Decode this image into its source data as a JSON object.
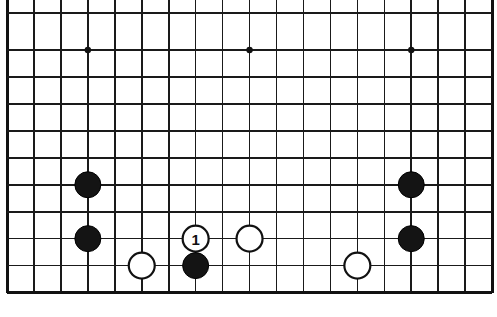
{
  "figure": {
    "kind": "go-board-diagram",
    "title": "",
    "caption": "",
    "board_size": 19,
    "colors": {
      "background": "#ffffff",
      "line": "#1a1a1a",
      "edge_line": "#111111",
      "black_stone": "#141414",
      "white_stone": "#ffffff"
    }
  },
  "board": {
    "geometry": {
      "origin_x": 7,
      "origin_y": 13,
      "spacing_x": 26.95,
      "spacing_y": 26.95,
      "cols": 19,
      "rows": 11,
      "first_row_gap": 37,
      "stone_radius": 13.0
    },
    "edges": {
      "left": true,
      "right": true,
      "top": false,
      "bottom": true
    },
    "hoshi": [
      {
        "col": 3,
        "row": 1
      },
      {
        "col": 9,
        "row": 1
      },
      {
        "col": 15,
        "row": 1
      }
    ]
  },
  "stones": [
    {
      "id": "b1",
      "color": "black",
      "col": 3,
      "row": 6,
      "label": "",
      "name": "black-stone-upper-left"
    },
    {
      "id": "b2",
      "color": "black",
      "col": 3,
      "row": 8,
      "label": "",
      "name": "black-stone-lower-left"
    },
    {
      "id": "w1",
      "color": "white",
      "col": 5,
      "row": 9,
      "label": "",
      "name": "white-stone-left"
    },
    {
      "id": "m1",
      "color": "white",
      "col": 7,
      "row": 8,
      "label": "1",
      "name": "white-stone-move-1"
    },
    {
      "id": "b3",
      "color": "black",
      "col": 7,
      "row": 9,
      "label": "",
      "name": "black-stone-center"
    },
    {
      "id": "w2",
      "color": "white",
      "col": 9,
      "row": 8,
      "label": "",
      "name": "white-stone-center-right"
    },
    {
      "id": "w3",
      "color": "white",
      "col": 13,
      "row": 9,
      "label": "",
      "name": "white-stone-right"
    },
    {
      "id": "b4",
      "color": "black",
      "col": 15,
      "row": 6,
      "label": "",
      "name": "black-stone-upper-right"
    },
    {
      "id": "b5",
      "color": "black",
      "col": 15,
      "row": 8,
      "label": "",
      "name": "black-stone-lower-right"
    }
  ],
  "move_markers": [
    {
      "number": "1",
      "on_stone": "m1",
      "stone_color": "white",
      "text_color": "#111111"
    }
  ]
}
